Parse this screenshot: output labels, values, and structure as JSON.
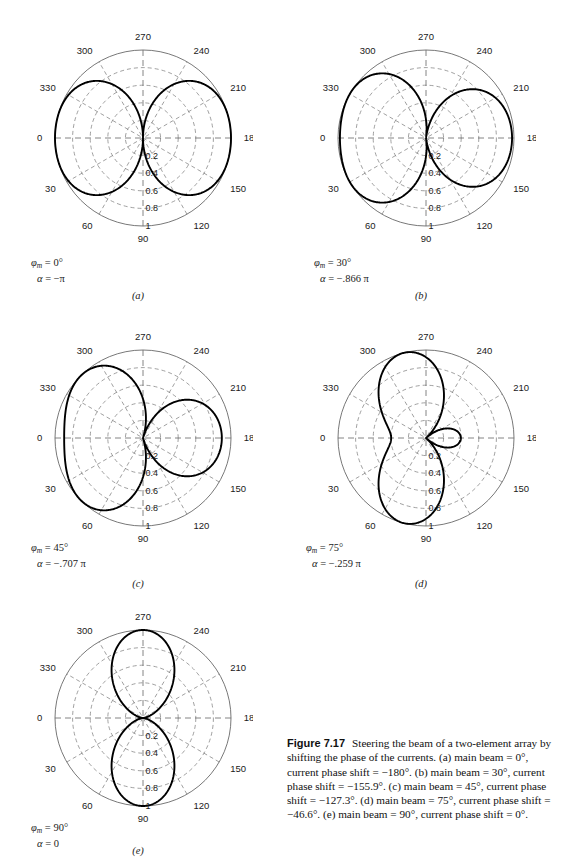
{
  "figure": {
    "number": "Figure 7.17",
    "title": "Steering the beam of a two-element array by shifting the phase of the currents.",
    "details": "(a) main beam = 0°, current phase shift = −180°. (b) main beam = 30°, current phase shift = −155.9°. (c) main beam = 45°, current phase shift = −127.3°. (d) main beam = 75°, current phase shift = −46.6°. (e) main beam = 90°, current phase shift = 0°."
  },
  "axes": {
    "angular_ticks": [
      "0",
      "30",
      "60",
      "90",
      "120",
      "150",
      "180",
      "210",
      "240",
      "270",
      "300",
      "330"
    ],
    "radial_ticks": [
      "0.2",
      "0.4",
      "0.6",
      "0.8",
      "1"
    ],
    "radial_max": 1,
    "angle_zero_position": "left",
    "angle_direction": "clockwise"
  },
  "panels": [
    {
      "id": "a",
      "label": "(a)",
      "phi_m_label": "φ",
      "phi_m_sub": "m",
      "phi_m_value": "= 0°",
      "alpha_value": "= −π",
      "main_beam_deg": 0,
      "phase_shift_deg": -180,
      "alpha_pi": -1.0
    },
    {
      "id": "b",
      "label": "(b)",
      "phi_m_label": "φ",
      "phi_m_sub": "m",
      "phi_m_value": "= 30°",
      "alpha_value": "= −.866 π",
      "main_beam_deg": 30,
      "phase_shift_deg": -155.9,
      "alpha_pi": -0.866
    },
    {
      "id": "c",
      "label": "(c)",
      "phi_m_label": "φ",
      "phi_m_sub": "m",
      "phi_m_value": "= 45°",
      "alpha_value": "= −.707 π",
      "main_beam_deg": 45,
      "phase_shift_deg": -127.3,
      "alpha_pi": -0.707
    },
    {
      "id": "d",
      "label": "(d)",
      "phi_m_label": "φ",
      "phi_m_sub": "m",
      "phi_m_value": "= 75°",
      "alpha_value": "= −.259 π",
      "main_beam_deg": 75,
      "phase_shift_deg": -46.6,
      "alpha_pi": -0.259
    },
    {
      "id": "e",
      "label": "(e)",
      "phi_m_label": "φ",
      "phi_m_sub": "m",
      "phi_m_value": "= 90°",
      "alpha_value": "= 0",
      "main_beam_deg": 90,
      "phase_shift_deg": 0,
      "alpha_pi": 0
    }
  ],
  "chart_data": {
    "type": "line",
    "subtype": "polar",
    "title": "Steering the beam of a two-element array by shifting the phase of the currents.",
    "xlabel": "φ (degrees)",
    "ylabel": "normalized array factor",
    "ylim": [
      0,
      1
    ],
    "grid": true,
    "legend": "none",
    "angular_tick_labels": [
      "0",
      "30",
      "60",
      "90",
      "120",
      "150",
      "180",
      "210",
      "240",
      "270",
      "300",
      "330"
    ],
    "radial_tick_labels": [
      "0.2",
      "0.4",
      "0.6",
      "0.8",
      "1"
    ],
    "formula": "F(phi) = |cos((pi*cos(phi) + alpha)/2)|",
    "series": [
      {
        "name": "(a)",
        "alpha_pi": -1.0,
        "main_beam_deg": 0,
        "peaks_deg": [
          0,
          180
        ]
      },
      {
        "name": "(b)",
        "alpha_pi": -0.866,
        "main_beam_deg": 30,
        "peaks_deg": [
          30,
          330
        ]
      },
      {
        "name": "(c)",
        "alpha_pi": -0.707,
        "main_beam_deg": 45,
        "peaks_deg": [
          45,
          315
        ]
      },
      {
        "name": "(d)",
        "alpha_pi": -0.259,
        "main_beam_deg": 75,
        "peaks_deg": [
          75,
          285
        ]
      },
      {
        "name": "(e)",
        "alpha_pi": 0,
        "main_beam_deg": 90,
        "peaks_deg": [
          90,
          270
        ]
      }
    ]
  }
}
